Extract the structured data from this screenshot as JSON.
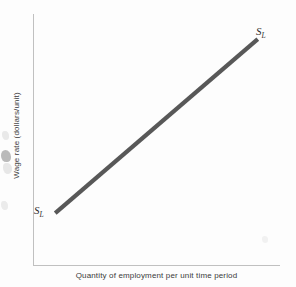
{
  "figure": {
    "background_color": "#fdfdfd",
    "axis_color": "#c0c0c0",
    "curve_color": "#585858"
  },
  "chart_data": {
    "type": "line",
    "title": "",
    "subtitle": "",
    "xlabel": "Quantity of employment per unit time period",
    "ylabel": "Wage rate (dollars/unit)",
    "xlim": [
      0,
      100
    ],
    "ylim": [
      0,
      100
    ],
    "grid": false,
    "x_ticks": [],
    "y_ticks": [],
    "legend": "none",
    "series": [
      {
        "name": "S_L",
        "label": "S",
        "label_subscript": "L",
        "description": "Upward-sloping labor supply curve",
        "color": "#585858",
        "linewidth": 4.2,
        "x": [
          9,
          91
        ],
        "y": [
          21,
          90
        ]
      }
    ],
    "annotations": [
      {
        "name": "supply-label-upper",
        "text": "S",
        "subscript": "L",
        "x": 93,
        "y": 95,
        "position": "above-right-of-curve-end"
      },
      {
        "name": "supply-label-lower",
        "text": "S",
        "subscript": "L",
        "x": 3,
        "y": 19,
        "position": "left-of-curve-start"
      }
    ]
  },
  "labels": {
    "y_axis_title": "Wage rate (dollars/unit)",
    "x_axis_title": "Quantity of employment per unit time period",
    "supply_symbol": "S",
    "supply_subscript": "L"
  }
}
